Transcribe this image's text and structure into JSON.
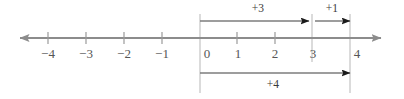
{
  "figure": {
    "colors": {
      "axis": "#8c8c8c",
      "guide": "#b0b0b0",
      "arrow": "#6e6e6e",
      "arrowhead": "#1a1a1a",
      "tick_text": "#565656",
      "op_text": "#3a3a3a",
      "background": "#ffffff"
    }
  },
  "number_line": {
    "axis_y": 38,
    "left_end_x": 20,
    "right_end_x": 381,
    "tick_half_height": 6,
    "ticks": [
      {
        "value": "-4",
        "label": "−4",
        "x": 48
      },
      {
        "value": "-3",
        "label": "−3",
        "x": 86
      },
      {
        "value": "-2",
        "label": "−2",
        "x": 124
      },
      {
        "value": "-1",
        "label": "−1",
        "x": 162
      },
      {
        "value": "0",
        "label": "0",
        "x": 200
      },
      {
        "value": "1",
        "label": "1",
        "x": 237
      },
      {
        "value": "2",
        "label": "2",
        "x": 275
      },
      {
        "value": "3",
        "label": "3",
        "x": 312
      },
      {
        "value": "4",
        "label": "4",
        "x": 350
      }
    ],
    "tick_label_y": 53
  },
  "guides": [
    {
      "name": "guide-at-0",
      "x": 200,
      "y1": 14,
      "y2": 93
    },
    {
      "name": "guide-at-3",
      "x": 312,
      "y1": 14,
      "y2": 62
    },
    {
      "name": "guide-at-4",
      "x": 350,
      "y1": 14,
      "y2": 93
    }
  ],
  "jumps": [
    {
      "id": "jump-plus-3",
      "label": "+3",
      "from": 0,
      "to": 3,
      "x1": 200,
      "x2": 312,
      "y": 21,
      "label_x": 258,
      "label_y": 9,
      "position": "above"
    },
    {
      "id": "jump-plus-1",
      "label": "+1",
      "from": 3,
      "to": 4,
      "x1": 315,
      "x2": 350,
      "y": 21,
      "label_x": 332,
      "label_y": 9,
      "position": "above"
    },
    {
      "id": "jump-plus-4",
      "label": "+4",
      "from": 0,
      "to": 4,
      "x1": 200,
      "x2": 350,
      "y": 73,
      "label_x": 273,
      "label_y": 85,
      "position": "below"
    }
  ]
}
